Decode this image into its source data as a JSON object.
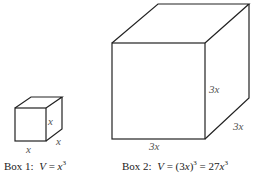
{
  "diagram": {
    "box1": {
      "edge_labels": {
        "front_right": "x",
        "depth": "x",
        "bottom": "x"
      },
      "caption": {
        "prefix": "Box 1:",
        "var": "V",
        "eq": "=",
        "base": "x",
        "exp": "3"
      }
    },
    "box2": {
      "edge_labels": {
        "front_right": "3x",
        "depth": "3x",
        "bottom": "3x"
      },
      "caption": {
        "prefix": "Box 2:",
        "var": "V",
        "eq": "=",
        "paren_open": "(3",
        "paren_var": "x",
        "paren_close": ")",
        "exp1": "3",
        "eq2": "= 27",
        "base2": "x",
        "exp2": "3"
      }
    },
    "stroke_color": "#222222"
  }
}
